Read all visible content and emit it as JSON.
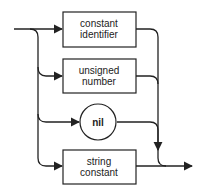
{
  "diagram": {
    "type": "syntax-diagram",
    "nodes": [
      {
        "id": "constant-identifier",
        "shape": "box",
        "lines": [
          "constant",
          "identifier"
        ]
      },
      {
        "id": "unsigned-number",
        "shape": "box",
        "lines": [
          "unsigned",
          "number"
        ]
      },
      {
        "id": "nil",
        "shape": "circle",
        "lines": [
          "nil"
        ]
      },
      {
        "id": "string-constant",
        "shape": "box",
        "lines": [
          "string",
          "constant"
        ]
      }
    ]
  }
}
